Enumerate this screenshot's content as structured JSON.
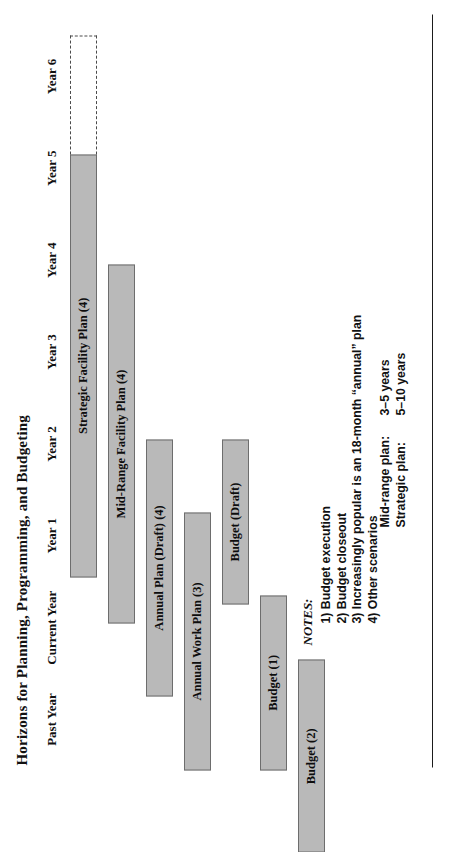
{
  "title": "Horizons for Planning, Programming, and Budgeting",
  "chart_data": {
    "type": "bar",
    "title": "Horizons for Planning, Programming, and Budgeting",
    "xlabel": "",
    "ylabel": "",
    "orientation": "horizontal-gantt",
    "grid": false,
    "legend": "none",
    "categories": [
      "Past Year",
      "Current Year",
      "Year 1",
      "Year 2",
      "Year 3",
      "Year 4",
      "Year 5",
      "Year 6"
    ],
    "axis_ticks": [
      "Past Year",
      "Current Year",
      "Year 1",
      "Year 2",
      "Year 3",
      "Year 4",
      "Year 5",
      "Year 6"
    ],
    "xlim": [
      0,
      8
    ],
    "bars": [
      {
        "label": "Strategic Facility Plan (4)",
        "start_index": 1.55,
        "end_index": 6.15,
        "row": 0,
        "style": "solid"
      },
      {
        "label": "",
        "start_index": 6.15,
        "end_index": 7.45,
        "row": 0,
        "style": "dashed"
      },
      {
        "label": "Mid-Range Facility Plan (4)",
        "start_index": 1.05,
        "end_index": 4.95,
        "row": 1,
        "style": "solid"
      },
      {
        "label": "Annual Plan (Draft) (4)",
        "start_index": 0.25,
        "end_index": 3.05,
        "row": 2,
        "style": "solid"
      },
      {
        "label": "Annual Work Plan (3)",
        "start_index": -0.55,
        "end_index": 2.25,
        "row": 3,
        "style": "solid"
      },
      {
        "label": "Budget (Draft)",
        "start_index": 1.25,
        "end_index": 3.05,
        "row": 4,
        "style": "solid"
      },
      {
        "label": "Budget (1)",
        "start_index": -0.55,
        "end_index": 1.35,
        "row": 5,
        "style": "solid"
      },
      {
        "label": "Budget (2)",
        "start_index": -1.45,
        "end_index": 0.65,
        "row": 6,
        "style": "solid"
      }
    ]
  },
  "notes": {
    "heading": "NOTES:",
    "items": [
      "1) Budget execution",
      "2) Budget closeout",
      "3) Increasingly popular is an 18-month “annual” plan",
      "4) Other scenarios"
    ]
  },
  "horizons": [
    {
      "label": "Mid-range plan:",
      "value": "3–5 years"
    },
    {
      "label": "Strategic plan:",
      "value": "5–10 years"
    }
  ]
}
